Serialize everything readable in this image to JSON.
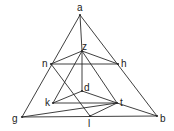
{
  "diagram": {
    "type": "geometric-graph",
    "vertices": [
      {
        "id": "a",
        "label": "a",
        "x": 80,
        "y": 15,
        "lx": 77,
        "ly": 11
      },
      {
        "id": "z",
        "label": "z",
        "x": 82,
        "y": 51,
        "lx": 82,
        "ly": 50
      },
      {
        "id": "n",
        "label": "n",
        "x": 51,
        "y": 64,
        "lx": 42,
        "ly": 67
      },
      {
        "id": "h",
        "label": "h",
        "x": 118,
        "y": 64,
        "lx": 121,
        "ly": 67
      },
      {
        "id": "d",
        "label": "d",
        "x": 82,
        "y": 91,
        "lx": 84,
        "ly": 91
      },
      {
        "id": "k",
        "label": "k",
        "x": 53,
        "y": 103,
        "lx": 45,
        "ly": 106
      },
      {
        "id": "t",
        "label": "t",
        "x": 117,
        "y": 103,
        "lx": 120,
        "ly": 106
      },
      {
        "id": "g",
        "label": "g",
        "x": 22,
        "y": 117,
        "lx": 12,
        "ly": 122
      },
      {
        "id": "l",
        "label": "l",
        "x": 90,
        "y": 116,
        "lx": 88,
        "ly": 127
      },
      {
        "id": "b",
        "label": "b",
        "x": 157,
        "y": 116,
        "lx": 160,
        "ly": 122
      }
    ],
    "edges": [
      [
        "a",
        "g"
      ],
      [
        "a",
        "b"
      ],
      [
        "g",
        "b"
      ],
      [
        "a",
        "z"
      ],
      [
        "z",
        "d"
      ],
      [
        "z",
        "n"
      ],
      [
        "z",
        "h"
      ],
      [
        "n",
        "h"
      ],
      [
        "z",
        "k"
      ],
      [
        "z",
        "t"
      ],
      [
        "n",
        "l"
      ],
      [
        "d",
        "k"
      ],
      [
        "d",
        "t"
      ],
      [
        "k",
        "t"
      ],
      [
        "g",
        "t"
      ],
      [
        "l",
        "t"
      ],
      [
        "t",
        "b"
      ]
    ]
  }
}
